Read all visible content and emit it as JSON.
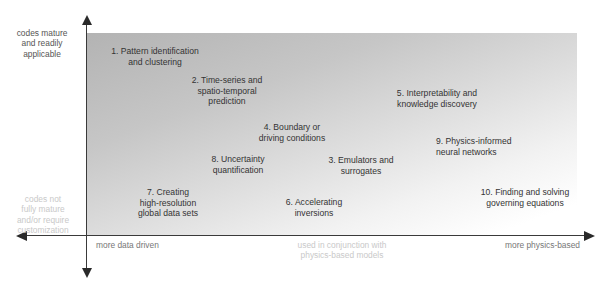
{
  "diagram": {
    "type": "quadrant-map",
    "y_axis": {
      "top_label": "codes mature\nand readily\napplicable",
      "bottom_label": "codes not\nfully mature\nand/or require\ncustomization"
    },
    "x_axis": {
      "left_label": "more data driven",
      "center_label": "used in conjunction with\nphysics-based models",
      "right_label": "more physics-based"
    },
    "items": [
      {
        "number": 1,
        "text": "1. Pattern identification\nand clustering"
      },
      {
        "number": 2,
        "text": "2. Time-series and\nspatio-temporal\nprediction"
      },
      {
        "number": 3,
        "text": "3. Emulators and\nsurrogates"
      },
      {
        "number": 4,
        "text": "4. Boundary or\ndriving conditions"
      },
      {
        "number": 5,
        "text": "5. Interpretability and\nknowledge discovery"
      },
      {
        "number": 6,
        "text": "6. Accelerating\ninversions"
      },
      {
        "number": 7,
        "text": "7. Creating\nhigh-resolution\nglobal data sets"
      },
      {
        "number": 8,
        "text": "8. Uncertainty\nquantification"
      },
      {
        "number": 9,
        "text": "9. Physics-informed\nneural networks"
      },
      {
        "number": 10,
        "text": "10. Finding and solving\ngoverning equations"
      }
    ],
    "colors": {
      "gradient_dark": "#b3b3b3",
      "gradient_light": "#ffffff",
      "axis": "#3a3a3a",
      "text": "#333333"
    }
  }
}
